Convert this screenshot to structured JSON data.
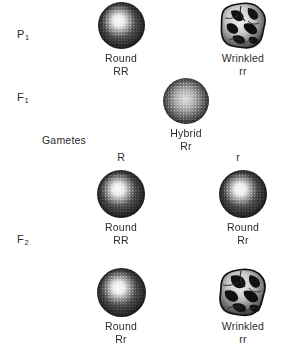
{
  "figure": {
    "background_color": "#ffffff",
    "ink_color": "#2b2b2b"
  },
  "generations": [
    {
      "key": "p1",
      "label": "P",
      "subscript": "1"
    },
    {
      "key": "f1",
      "label": "F",
      "subscript": "1"
    },
    {
      "key": "f2",
      "label": "F",
      "subscript": "2"
    }
  ],
  "side_labels": {
    "gametes": "Gametes"
  },
  "gamete_letters": [
    {
      "name": "gamete-dominant",
      "text": "R"
    },
    {
      "name": "gamete-recessive",
      "text": "r"
    }
  ],
  "seeds": {
    "p1_round": {
      "shape": "round",
      "phenotype": "Round",
      "genotype": "RR"
    },
    "p1_wrinkled": {
      "shape": "wrinkled",
      "phenotype": "Wrinkled",
      "genotype": "rr"
    },
    "f1_hybrid": {
      "shape": "round",
      "phenotype": "Hybrid",
      "genotype": "Rr"
    },
    "f2_round_rr_dom": {
      "shape": "round",
      "phenotype": "Round",
      "genotype": "RR"
    },
    "f2_round_rr_het1": {
      "shape": "round",
      "phenotype": "Round",
      "genotype": "Rr"
    },
    "f2_round_rr_het2": {
      "shape": "round",
      "phenotype": "Round",
      "genotype": "Rr"
    },
    "f2_wrinkled": {
      "shape": "wrinkled",
      "phenotype": "Wrinkled",
      "genotype": "rr"
    }
  }
}
